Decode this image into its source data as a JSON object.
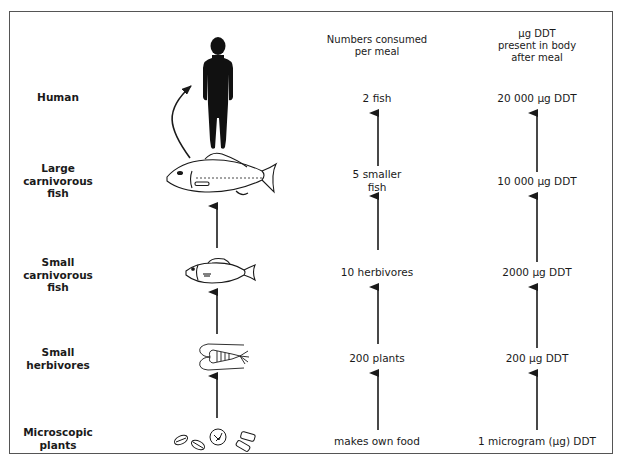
{
  "diagram": {
    "headers": {
      "consumed": [
        "Numbers consumed",
        "per meal"
      ],
      "ddt": [
        "μg DDT",
        "present in body",
        "after meal"
      ]
    },
    "levels": [
      {
        "organism": [
          "Human"
        ],
        "icon": "human-silhouette-icon",
        "consumed": [
          "2 fish"
        ],
        "ddt": [
          "20 000 μg DDT"
        ]
      },
      {
        "organism": [
          "Large",
          "carnivorous",
          "fish"
        ],
        "icon": "large-fish-icon",
        "consumed": [
          "5 smaller",
          "fish"
        ],
        "ddt": [
          "10 000 μg DDT"
        ]
      },
      {
        "organism": [
          "Small",
          "carnivorous",
          "fish"
        ],
        "icon": "small-fish-icon",
        "consumed": [
          "10 herbivores"
        ],
        "ddt": [
          "2000 μg DDT"
        ]
      },
      {
        "organism": [
          "Small",
          "herbivores"
        ],
        "icon": "shrimp-icon",
        "consumed": [
          "200 plants"
        ],
        "ddt": [
          "200 μg DDT"
        ]
      },
      {
        "organism": [
          "Microscopic",
          "plants"
        ],
        "icon": "phytoplankton-icon",
        "consumed": [
          "makes own food"
        ],
        "ddt": [
          "1 microgram (μg) DDT"
        ]
      }
    ],
    "colors": {
      "ink": "#1a1a1a",
      "frame": "#555555",
      "background": "#ffffff"
    }
  }
}
